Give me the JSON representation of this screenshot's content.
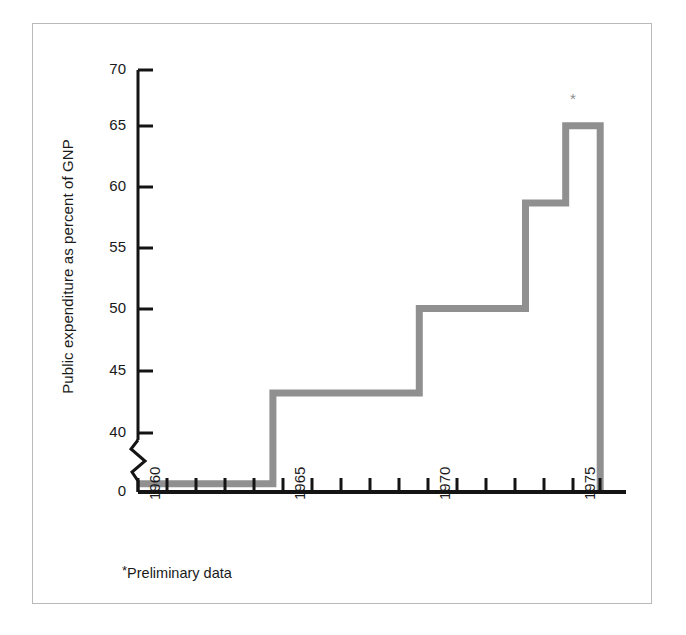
{
  "figure": {
    "background_color": "#ffffff",
    "frame_color": "#b9b9b9",
    "axis_color": "#141414",
    "series_color": "#909090"
  },
  "footnote": {
    "marker": "*",
    "text": "Preliminary data"
  },
  "series_marker": "*",
  "chart_data": {
    "type": "area",
    "subtype": "step",
    "title": "",
    "subtitle": "",
    "xlabel": "",
    "ylabel": "Public expenditure as percent of GNP",
    "ylim": [
      0,
      70
    ],
    "y_axis_break": true,
    "y_axis_break_between": [
      0,
      40
    ],
    "grid": false,
    "legend": null,
    "y_ticks": [
      0,
      40,
      45,
      50,
      55,
      60,
      65,
      70
    ],
    "y_tick_labels": [
      "0",
      "40",
      "45",
      "50",
      "55",
      "60",
      "65",
      "70"
    ],
    "xlim": [
      1960,
      1977
    ],
    "x_ticks": [
      1960,
      1961,
      1962,
      1963,
      1964,
      1965,
      1966,
      1967,
      1968,
      1969,
      1970,
      1971,
      1972,
      1973,
      1974,
      1975,
      1976
    ],
    "x_tick_labels": [
      "1960",
      "",
      "",
      "",
      "",
      "1965",
      "",
      "",
      "",
      "",
      "1970",
      "",
      "",
      "",
      "",
      "1975",
      ""
    ],
    "x_labeled_ticks": [
      {
        "value": 1960,
        "label": "1960"
      },
      {
        "value": 1965,
        "label": "1965"
      },
      {
        "value": 1970,
        "label": "1970"
      },
      {
        "value": 1975,
        "label": "1975"
      }
    ],
    "x": [
      1960,
      1964.7,
      1969.8,
      1973.5,
      1974.9,
      1976.1
    ],
    "categories": [
      "1960-1964",
      "1965-1969",
      "1970-1973",
      "1974",
      "1975"
    ],
    "values": [
      35.8,
      43.3,
      50.3,
      59.0,
      65.4
    ],
    "steps": [
      {
        "x_start": 1960.0,
        "x_end": 1964.7,
        "value": 35.8
      },
      {
        "x_start": 1964.7,
        "x_end": 1969.8,
        "value": 43.3
      },
      {
        "x_start": 1969.8,
        "x_end": 1973.5,
        "value": 50.3
      },
      {
        "x_start": 1973.5,
        "x_end": 1974.9,
        "value": 59.0
      },
      {
        "x_start": 1974.9,
        "x_end": 1976.1,
        "value": 65.4
      }
    ],
    "annotations": [
      {
        "text": "*",
        "x": 1975.5,
        "y": 67.5,
        "note": "Preliminary data marker above final step"
      }
    ]
  }
}
